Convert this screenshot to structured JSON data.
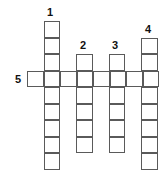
{
  "puzzle": {
    "type": "crossword",
    "clue_numbers": [
      {
        "number": "1",
        "direction": "down",
        "length": 9
      },
      {
        "number": "2",
        "direction": "down",
        "length": 6
      },
      {
        "number": "3",
        "direction": "down",
        "length": 6
      },
      {
        "number": "4",
        "direction": "down",
        "length": 8
      },
      {
        "number": "5",
        "direction": "across",
        "length": 8
      }
    ],
    "cell_size": 16.5,
    "border_color": "#5a5a5a"
  }
}
